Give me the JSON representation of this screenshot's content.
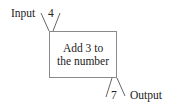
{
  "diagram": {
    "type": "function-machine",
    "input": {
      "label": "Input",
      "value": "4"
    },
    "process": {
      "line1": "Add 3 to",
      "line2": "the number"
    },
    "output": {
      "label": "Output",
      "value": "7"
    }
  }
}
